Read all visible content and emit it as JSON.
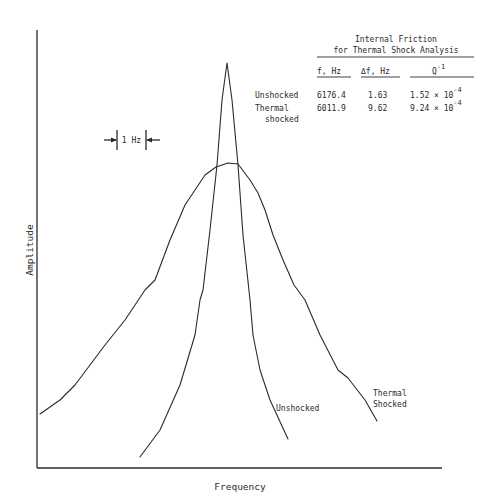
{
  "chart_data": {
    "type": "line",
    "title": "",
    "xlabel": "Frequency",
    "ylabel": "Amplitude",
    "grid": false,
    "legend": "inline labels on curves",
    "scale_marker": "1 Hz",
    "series": [
      {
        "name": "Unshocked",
        "description": "narrow resonance peak",
        "points_px": [
          [
            140,
            457
          ],
          [
            160,
            430
          ],
          [
            180,
            385
          ],
          [
            195,
            335
          ],
          [
            200,
            300
          ],
          [
            203,
            290
          ],
          [
            210,
            230
          ],
          [
            217,
            165
          ],
          [
            222,
            100
          ],
          [
            227,
            63
          ],
          [
            232,
            100
          ],
          [
            238,
            165
          ],
          [
            243,
            235
          ],
          [
            250,
            300
          ],
          [
            253,
            335
          ],
          [
            260,
            370
          ],
          [
            270,
            400
          ],
          [
            288,
            439
          ]
        ]
      },
      {
        "name": "Thermal Shocked",
        "description": "broad resonance peak",
        "points_px": [
          [
            40,
            414
          ],
          [
            60,
            400
          ],
          [
            75,
            385
          ],
          [
            105,
            345
          ],
          [
            125,
            320
          ],
          [
            145,
            290
          ],
          [
            155,
            280
          ],
          [
            170,
            240
          ],
          [
            185,
            205
          ],
          [
            205,
            175
          ],
          [
            216,
            167
          ],
          [
            228,
            163
          ],
          [
            238,
            164
          ],
          [
            250,
            180
          ],
          [
            258,
            193
          ],
          [
            265,
            210
          ],
          [
            273,
            235
          ],
          [
            283,
            260
          ],
          [
            294,
            285
          ],
          [
            305,
            300
          ],
          [
            320,
            335
          ],
          [
            338,
            370
          ],
          [
            348,
            378
          ],
          [
            365,
            400
          ],
          [
            377,
            421
          ]
        ]
      }
    ],
    "table": {
      "title_line1": "Internal Friction",
      "title_line2": "for Thermal Shock Analysis",
      "columns": [
        "",
        "f, Hz",
        "Δf, Hz",
        "Q⁻¹"
      ],
      "rows": [
        {
          "label": "Unshocked",
          "f_hz": 6176.4,
          "delta_f_hz": 1.63,
          "q_inv": "1.52 × 10⁻⁴"
        },
        {
          "label": "Thermal shocked",
          "f_hz": 6011.9,
          "delta_f_hz": 9.62,
          "q_inv": "9.24 × 10⁻⁴"
        }
      ]
    }
  },
  "axes": {
    "xlabel": "Frequency",
    "ylabel": "Amplitude"
  },
  "scale": {
    "label": "1 Hz"
  },
  "labels": {
    "unshocked": "Unshocked",
    "thermal_line1": "Thermal",
    "thermal_line2": "Shocked"
  },
  "table": {
    "title_line1": "Internal Friction",
    "title_line2": "for Thermal Shock Analysis",
    "headers": {
      "f": "f, Hz",
      "df": "Δf, Hz",
      "q": "Q",
      "q_exp": "-1"
    },
    "rows": [
      {
        "label_line1": "Unshocked",
        "label_line2": "",
        "f": "6176.4",
        "df": "1.63",
        "q": "1.52 × 10",
        "q_exp": "-4"
      },
      {
        "label_line1": "Thermal",
        "label_line2": "shocked",
        "f": "6011.9",
        "df": "9.62",
        "q": "9.24 × 10",
        "q_exp": "-4"
      }
    ]
  }
}
